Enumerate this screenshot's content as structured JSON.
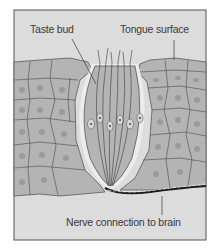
{
  "diagram": {
    "type": "anatomical-illustration",
    "labels": {
      "taste_bud": "Taste bud",
      "tongue_surface": "Tongue surface",
      "nerve": "Nerve connection to brain"
    },
    "colors": {
      "background": "#dcdcdc",
      "cell_fill": "#b4b4b4",
      "cell_outline": "#4a4a4a",
      "bud_halo": "#ececec",
      "frame": "#555555",
      "nerve": "#1a1a1a"
    }
  }
}
